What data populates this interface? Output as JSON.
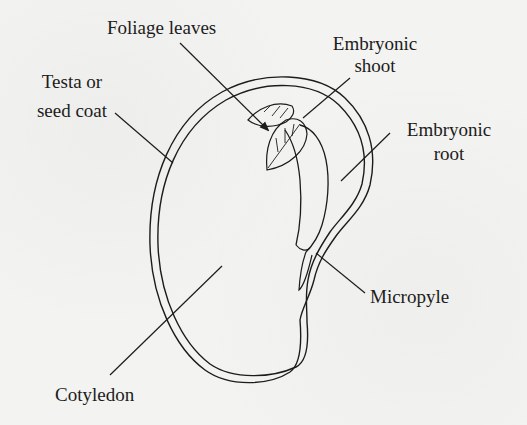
{
  "diagram": {
    "labels": {
      "foliage_leaves": "Foliage leaves",
      "testa_line1": "Testa or",
      "testa_line2": "seed coat",
      "embryonic_shoot_line1": "Embryonic",
      "embryonic_shoot_line2": "shoot",
      "embryonic_root_line1": "Embryonic",
      "embryonic_root_line2": "root",
      "micropyle": "Micropyle",
      "cotyledon": "Cotyledon"
    },
    "colors": {
      "ink": "#1c1c1c",
      "paper": "#f3f3f1"
    }
  }
}
